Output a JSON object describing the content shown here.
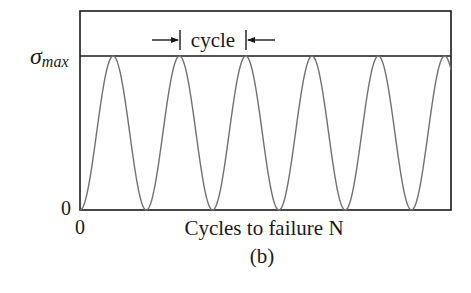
{
  "figure": {
    "panel_label": "(b)",
    "x_axis_label": "Cycles to failure N",
    "x_origin_label": "0",
    "y_origin_label": "0",
    "y_max_label_symbol": "σ",
    "y_max_label_subscript": "max",
    "cycle_annotation": "cycle",
    "colors": {
      "frame": "#1a1a1a",
      "curve": "#707070",
      "text": "#1a1a1a"
    }
  },
  "chart_data": {
    "type": "line",
    "title": "",
    "xlabel": "Cycles to failure N",
    "ylabel": "σmax",
    "y_ticks": [
      "0",
      "σmax"
    ],
    "x_ticks": [
      "0"
    ],
    "series": [
      {
        "name": "stress",
        "waveform": "sinusoid (1 - cos)",
        "min": 0,
        "max": "σmax",
        "cycles_shown": 5.5,
        "peaks_at_cycle": [
          0.5,
          1.5,
          2.5,
          3.5,
          4.5,
          5.5
        ],
        "troughs_at_cycle": [
          0,
          1,
          2,
          3,
          4,
          5
        ]
      }
    ],
    "annotations": [
      {
        "text": "cycle",
        "type": "dimension arrows",
        "spans": "one period between consecutive peaks"
      }
    ],
    "grid": false
  }
}
